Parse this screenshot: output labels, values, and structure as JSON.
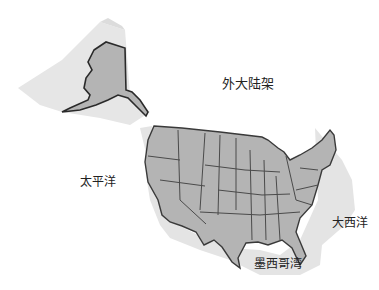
{
  "map": {
    "colors": {
      "land": "#b4b4b4",
      "border": "#4a4a4a",
      "shelf": "#e4e4e4",
      "background": "#ffffff"
    },
    "labels": {
      "outer_shelf": "外大陆架",
      "pacific": "太平洋",
      "atlantic": "大西洋",
      "gulf": "墨西哥湾"
    }
  }
}
